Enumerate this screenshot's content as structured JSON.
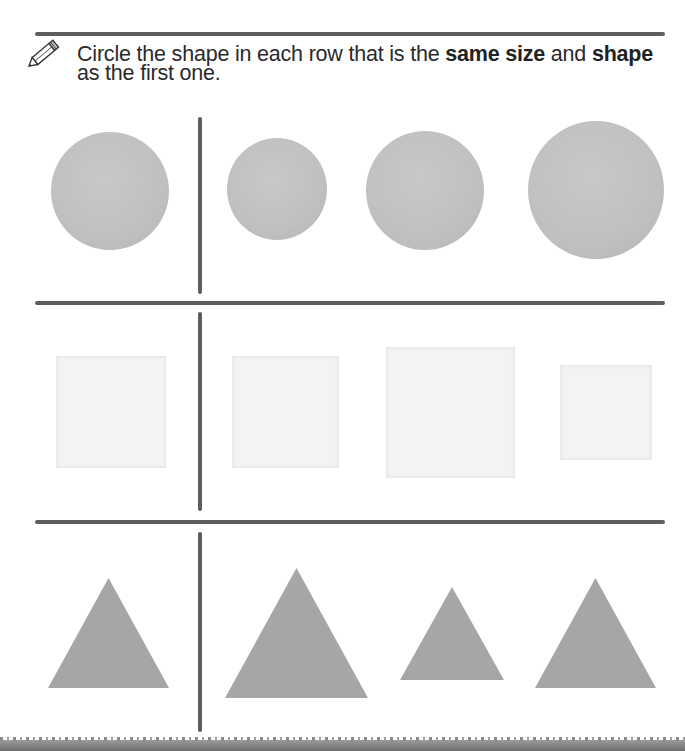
{
  "instruction": {
    "icon": "pencil-icon",
    "parts": [
      {
        "text": "Circle the shape in each row that is the ",
        "bold": false
      },
      {
        "text": "same size",
        "bold": true
      },
      {
        "text": " and ",
        "bold": false
      },
      {
        "text": "shape",
        "bold": true
      },
      {
        "text": " as the first one.",
        "bold": false
      }
    ]
  },
  "colors": {
    "rule": "#5e5e5e",
    "circle_fill": "#c0c0c0",
    "square_fill": "#f3f3f3",
    "triangle_fill": "#a6a6a6",
    "text": "#2a2a2a"
  },
  "rows": [
    {
      "shape": "circle",
      "reference": {
        "size": 118
      },
      "options": [
        {
          "size": 100
        },
        {
          "size": 118
        },
        {
          "size": 136
        }
      ],
      "correct_option_index": 1
    },
    {
      "shape": "square",
      "reference": {
        "size": 110
      },
      "options": [
        {
          "size": 110
        },
        {
          "size": 130
        },
        {
          "size": 93
        }
      ],
      "correct_option_index": 0
    },
    {
      "shape": "triangle",
      "reference": {
        "width": 120,
        "height": 109
      },
      "options": [
        {
          "width": 142,
          "height": 129
        },
        {
          "width": 103,
          "height": 92
        },
        {
          "width": 120,
          "height": 109
        }
      ],
      "correct_option_index": 2
    }
  ]
}
